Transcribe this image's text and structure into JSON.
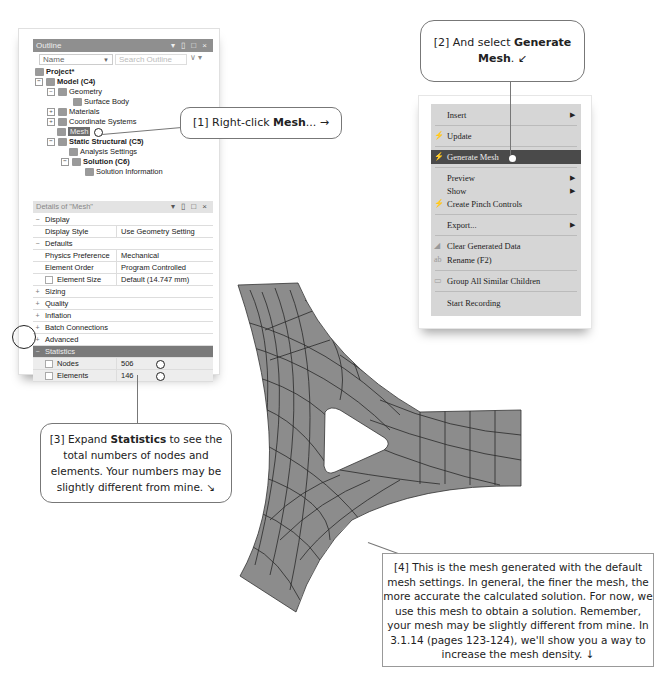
{
  "outline": {
    "title": "Outline",
    "window_buttons": "▾ ▯ □ ×",
    "name_filter": "Name",
    "search_placeholder": "Search Outline",
    "tree": [
      {
        "label": "Project*",
        "bold": true
      },
      {
        "label": "Model (C4)",
        "bold": true
      },
      {
        "label": "Geometry"
      },
      {
        "label": "Surface Body"
      },
      {
        "label": "Materials"
      },
      {
        "label": "Coordinate Systems"
      },
      {
        "label": "Mesh",
        "selected": true
      },
      {
        "label": "Static Structural (C5)",
        "bold": true
      },
      {
        "label": "Analysis Settings"
      },
      {
        "label": "Solution (C6)",
        "bold": true
      },
      {
        "label": "Solution Information"
      }
    ]
  },
  "details": {
    "title": "Details of \"Mesh\"",
    "window_buttons": "▾ ▯ □ ×",
    "rows": [
      {
        "type": "group",
        "state": "−",
        "label": "Display"
      },
      {
        "type": "prop",
        "label": "Display Style",
        "value": "Use Geometry Setting"
      },
      {
        "type": "group",
        "state": "−",
        "label": "Defaults"
      },
      {
        "type": "prop",
        "label": "Physics Preference",
        "value": "Mechanical"
      },
      {
        "type": "prop",
        "label": "Element Order",
        "value": "Program Controlled"
      },
      {
        "type": "prop",
        "label": "Element Size",
        "value": "Default (14.747 mm)",
        "checkbox": true
      },
      {
        "type": "group",
        "state": "+",
        "label": "Sizing"
      },
      {
        "type": "group",
        "state": "+",
        "label": "Quality"
      },
      {
        "type": "group",
        "state": "+",
        "label": "Inflation"
      },
      {
        "type": "group",
        "state": "+",
        "label": "Batch Connections"
      },
      {
        "type": "group",
        "state": "+",
        "label": "Advanced"
      },
      {
        "type": "group",
        "state": "−",
        "label": "Statistics"
      },
      {
        "type": "prop",
        "label": "Nodes",
        "value": "506",
        "checkbox": true
      },
      {
        "type": "prop",
        "label": "Elements",
        "value": "146",
        "checkbox": true
      }
    ]
  },
  "context_menu": {
    "items": [
      {
        "label": "Insert",
        "submenu": true
      },
      {
        "label": "Update",
        "icon": "lightning-icon"
      },
      {
        "label": "Generate Mesh",
        "icon": "lightning-icon",
        "active": true
      },
      {
        "label": "Preview",
        "submenu": true
      },
      {
        "label": "Show",
        "submenu": true
      },
      {
        "label": "Create Pinch Controls",
        "icon": "lightning-icon"
      },
      {
        "label": "Export...",
        "submenu": true
      },
      {
        "label": "Clear Generated Data",
        "icon": "clear-icon"
      },
      {
        "label": "Rename (F2)",
        "icon": "rename-icon"
      },
      {
        "label": "Group All Similar Children",
        "icon": "folder-icon"
      },
      {
        "label": "Start Recording"
      }
    ]
  },
  "callouts": {
    "c1": {
      "prefix": "[1] Right-click ",
      "bold": "Mesh",
      "suffix": "... →"
    },
    "c2": {
      "prefix": "[2] And select ",
      "bold": "Generate Mesh",
      "suffix": ". ↙"
    },
    "c3": {
      "prefix": "[3] Expand ",
      "bold": "Statistics",
      "suffix": " to see the total numbers of nodes and elements. Your numbers may be slightly different from mine. ↘"
    },
    "c4": {
      "text": "[4] This is the mesh generated with the default mesh settings.  In general, the finer the mesh, the more accurate the calculated solution.  For now, we use this mesh to obtain a solution. Remember, your mesh may be slightly different from mine.  In 3.1.14 (pages 123-124), we'll show you a way to increase the mesh density. ↓"
    }
  },
  "colors": {
    "mesh_fill": "#8c8c8c",
    "mesh_lines": "#2a2a2a",
    "menu_bg": "#d6d6d6",
    "menu_active": "#4a4a4a",
    "statistics_row": "#7a7a7a"
  }
}
